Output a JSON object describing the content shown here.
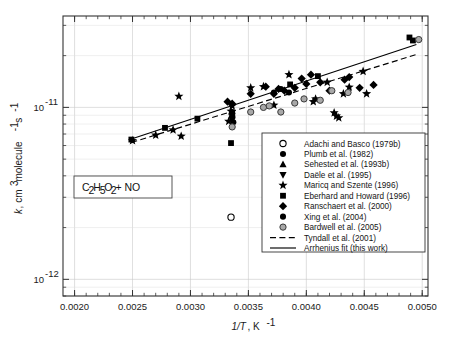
{
  "figure": {
    "annotation": "C2H5O2 + NO",
    "annotation_parts": {
      "c": "C",
      "sub2a": "2",
      "h": "H",
      "sub5": "5",
      "o": "O",
      "sub2b": "2",
      "tail": " + NO"
    }
  },
  "axes": {
    "x": {
      "label_main": "1/T",
      "label_sub": ", K",
      "label_exp": "-1",
      "ticks": [
        "0.0020",
        "0.0025",
        "0.0030",
        "0.0035",
        "0.0040",
        "0.0045",
        "0.0050"
      ],
      "tick_values": [
        0.002,
        0.0025,
        0.003,
        0.0035,
        0.004,
        0.0045,
        0.005
      ],
      "range": [
        0.0019,
        0.00505
      ]
    },
    "y": {
      "label_k": "k",
      "label_rest": ", cm",
      "label_exp3": "3",
      "label_mol": " molecule",
      "label_expm1": "-1",
      "label_s": " s",
      "label_expm1b": "-1",
      "ticks": [
        {
          "mantissa": "10",
          "exponent": "-11",
          "value": 1e-11
        },
        {
          "mantissa": "10",
          "exponent": "-12",
          "value": 1e-12
        }
      ],
      "range": [
        8e-13,
        3.4e-11
      ],
      "scale": "log"
    }
  },
  "legend": {
    "entries": [
      {
        "label": "Adachi and Basco (1979b)",
        "marker": "circle-open"
      },
      {
        "label": "Plumb et al. (1982)",
        "marker": "circle-filled"
      },
      {
        "label": "Sehested et al. (1993b)",
        "marker": "triangle-up-filled"
      },
      {
        "label": "Daële et al. (1995)",
        "marker": "triangle-down-filled"
      },
      {
        "label": "Maricq and Szente (1996)",
        "marker": "star-filled"
      },
      {
        "label": "Eberhard and Howard (1996)",
        "marker": "square-filled"
      },
      {
        "label": "Ranschaert et al. (2000)",
        "marker": "diamond-filled"
      },
      {
        "label": "Xing et al. (2004)",
        "marker": "circle-filled"
      },
      {
        "label": "Bardwell et al. (2005)",
        "marker": "circle-gray"
      },
      {
        "label": "Tyndall et al. (2001)",
        "marker": "line-dashed"
      },
      {
        "label": "Arrhenius fit (this work)",
        "marker": "line-solid"
      }
    ]
  },
  "chart_data": {
    "type": "scatter",
    "title": "",
    "xlabel": "1/T, K^-1",
    "ylabel": "k, cm^3 molecule^-1 s^-1",
    "xlim": [
      0.0019,
      0.00505
    ],
    "ylim": [
      8e-13,
      3.4e-11
    ],
    "yscale": "log",
    "grid": true,
    "legend_position": "lower-right",
    "annotation": "C2H5O2 + NO",
    "series": [
      {
        "name": "Adachi and Basco (1979b)",
        "marker": "circle-open",
        "points": [
          [
            0.00335,
            2.3e-12
          ]
        ]
      },
      {
        "name": "Plumb et al. (1982)",
        "marker": "circle-filled",
        "points": [
          [
            0.00336,
            8.7e-12
          ],
          [
            0.00337,
            8.2e-12
          ]
        ]
      },
      {
        "name": "Sehested et al. (1993b)",
        "marker": "triangle-up-filled",
        "points": [
          [
            0.00336,
            9e-12
          ]
        ]
      },
      {
        "name": "Daële et al. (1995)",
        "marker": "triangle-down-filled",
        "points": [
          [
            0.00336,
            8.9e-12
          ],
          [
            0.00336,
            8.6e-12
          ]
        ]
      },
      {
        "name": "Maricq and Szente (1996)",
        "marker": "star-filled",
        "points": [
          [
            0.0025,
            6.4e-12
          ],
          [
            0.0027,
            6.9e-12
          ],
          [
            0.00285,
            7.4e-12
          ],
          [
            0.0029,
            1.16e-11
          ],
          [
            0.00292,
            6.8e-12
          ],
          [
            0.00333,
            8.3e-12
          ],
          [
            0.00335,
            9.5e-12
          ],
          [
            0.00336,
            1.02e-11
          ],
          [
            0.00352,
            1.3e-11
          ],
          [
            0.00363,
            1.32e-11
          ],
          [
            0.00372,
            1.03e-11
          ],
          [
            0.00385,
            1.55e-11
          ],
          [
            0.00406,
            1.08e-11
          ],
          [
            0.00408,
            1.12e-11
          ],
          [
            0.00418,
            1.4e-11
          ],
          [
            0.00424,
            9.3e-12
          ],
          [
            0.00426,
            8.9e-12
          ],
          [
            0.00428,
            8.7e-12
          ],
          [
            0.00432,
            1.2e-11
          ],
          [
            0.00437,
            1.31e-11
          ],
          [
            0.00449,
            1.62e-11
          ],
          [
            0.00452,
            1.2e-11
          ]
        ]
      },
      {
        "name": "Eberhard and Howard (1996)",
        "marker": "square-filled",
        "points": [
          [
            0.00249,
            6.5e-12
          ],
          [
            0.00278,
            7.6e-12
          ],
          [
            0.00306,
            8.6e-12
          ],
          [
            0.00335,
            6.2e-12
          ],
          [
            0.00336,
            9.1e-12
          ],
          [
            0.00386,
            1.36e-11
          ],
          [
            0.0041,
            1.52e-11
          ],
          [
            0.00489,
            2.55e-11
          ],
          [
            0.00492,
            2.45e-11
          ]
        ]
      },
      {
        "name": "Ranschaert et al. (2000)",
        "marker": "diamond-filled",
        "points": [
          [
            0.00332,
            1.08e-11
          ],
          [
            0.00336,
            1.05e-11
          ],
          [
            0.00352,
            1.2e-11
          ],
          [
            0.00365,
            1.32e-11
          ],
          [
            0.00372,
            1.2e-11
          ],
          [
            0.00376,
            1.28e-11
          ],
          [
            0.00381,
            1.25e-11
          ],
          [
            0.0039,
            1.3e-11
          ],
          [
            0.00396,
            1.47e-11
          ],
          [
            0.004,
            1.37e-11
          ],
          [
            0.00404,
            1.55e-11
          ],
          [
            0.00412,
            1.4e-11
          ],
          [
            0.0042,
            1.25e-11
          ],
          [
            0.00433,
            1.45e-11
          ],
          [
            0.00437,
            1.5e-11
          ],
          [
            0.00446,
            1.3e-11
          ],
          [
            0.00458,
            1.35e-11
          ]
        ]
      },
      {
        "name": "Xing et al. (2004)",
        "marker": "circle-filled",
        "points": [
          [
            0.00336,
            9.4e-12
          ],
          [
            0.00372,
            1.22e-11
          ],
          [
            0.00378,
            1.28e-11
          ],
          [
            0.00385,
            1.22e-11
          ]
        ]
      },
      {
        "name": "Bardwell et al. (2005)",
        "marker": "circle-gray",
        "points": [
          [
            0.00336,
            7.7e-12
          ],
          [
            0.00352,
            9.4e-12
          ],
          [
            0.00363,
            1e-11
          ],
          [
            0.00368,
            1.02e-11
          ],
          [
            0.00378,
            9.4e-12
          ],
          [
            0.0039,
            1.06e-11
          ],
          [
            0.00398,
            1.12e-11
          ],
          [
            0.00412,
            1.1e-11
          ],
          [
            0.00422,
            1.25e-11
          ],
          [
            0.00436,
            1.22e-11
          ],
          [
            0.00497,
            2.48e-11
          ]
        ]
      }
    ],
    "fits": [
      {
        "name": "Tyndall et al. (2001)",
        "style": "dashed",
        "endpoints": [
          [
            0.00249,
            6.25e-12
          ],
          [
            0.00495,
            2.03e-11
          ]
        ]
      },
      {
        "name": "Arrhenius fit (this work)",
        "style": "solid",
        "endpoints": [
          [
            0.00249,
            6.55e-12
          ],
          [
            0.00495,
            2.32e-11
          ]
        ]
      }
    ]
  }
}
